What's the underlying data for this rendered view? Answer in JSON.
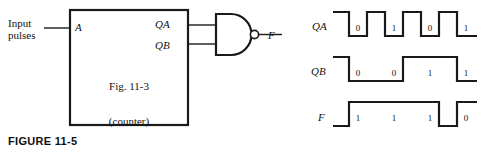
{
  "figure": {
    "caption": "FIGURE 11-5"
  },
  "circuit": {
    "input_label": "Input\npulses",
    "block": {
      "input_port": "A",
      "output_ports": [
        "QA",
        "QB"
      ],
      "caption_line1": "Fig. 11-3",
      "caption_line2": "(counter)"
    },
    "gate": {
      "type": "nand-gate",
      "output_label": "F",
      "inputs": [
        "QA",
        "QB"
      ]
    }
  },
  "timing": {
    "waveforms": [
      {
        "name": "QA",
        "bits": [
          "0",
          "1",
          "0",
          "1"
        ],
        "levels": [
          1,
          0,
          1,
          0,
          1,
          0,
          1,
          0,
          1
        ],
        "description": "toggles every cell"
      },
      {
        "name": "QB",
        "bits": [
          "0",
          "0",
          "1",
          "1"
        ],
        "levels": [
          1,
          0,
          0,
          0,
          0,
          1,
          1,
          1,
          0
        ],
        "description": "toggles every two cells"
      },
      {
        "name": "F",
        "bits": [
          "1",
          "1",
          "1",
          "0"
        ],
        "levels": [
          0,
          1,
          1,
          1,
          1,
          1,
          1,
          0,
          1
        ],
        "description": "NAND of QA and QB"
      }
    ]
  },
  "style": {
    "line_color": "#1a1a1a",
    "background": "#ffffff"
  }
}
